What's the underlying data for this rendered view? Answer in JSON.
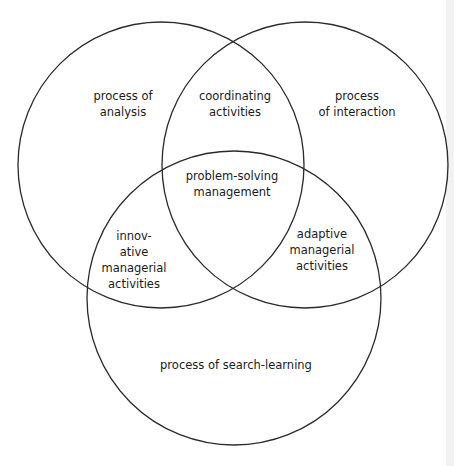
{
  "diagram": {
    "type": "venn",
    "sets": [
      {
        "id": "analysis",
        "label": "process of analysis"
      },
      {
        "id": "interaction",
        "label": "process of interaction"
      },
      {
        "id": "search",
        "label": "process of search-learning"
      }
    ],
    "regions": {
      "analysis": [
        "process of",
        "analysis"
      ],
      "interaction": [
        "process",
        "of interaction"
      ],
      "analysis_interaction": [
        "coordinating",
        "activities"
      ],
      "center": [
        "problem-solving",
        "management"
      ],
      "analysis_search": [
        "innov-",
        "ative",
        "managerial",
        "activities"
      ],
      "interaction_search": [
        "adaptive",
        "managerial",
        "activities"
      ],
      "search": [
        "process of search-learning"
      ]
    },
    "stroke_color": "#2a2a2a"
  }
}
